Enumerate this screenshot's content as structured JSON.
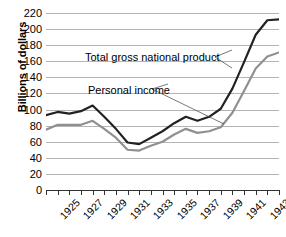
{
  "chart_data": {
    "type": "line",
    "title": "",
    "xlabel": "",
    "ylabel": "Billions of dollars",
    "ylim": [
      0,
      220
    ],
    "xlim": [
      1925,
      1945
    ],
    "grid": true,
    "legend_position": "inline-annotations",
    "y_ticks": [
      0,
      20,
      40,
      60,
      80,
      100,
      120,
      140,
      160,
      180,
      200,
      220
    ],
    "x_ticks": [
      1925,
      1926,
      1927,
      1928,
      1929,
      1930,
      1931,
      1932,
      1933,
      1934,
      1935,
      1936,
      1937,
      1938,
      1939,
      1940,
      1941,
      1942,
      1943,
      1944,
      1945
    ],
    "x_tick_labels": [
      "1925",
      "",
      "1927",
      "",
      "1929",
      "",
      "1931",
      "",
      "1933",
      "",
      "1935",
      "",
      "1937",
      "",
      "1939",
      "",
      "1941",
      "",
      "1943",
      "",
      "1945"
    ],
    "x_labels_visible": [
      "1925",
      "1927",
      "1929",
      "1931",
      "1933",
      "1935",
      "1937",
      "1939",
      "1941",
      "1943",
      "1945"
    ],
    "x": [
      1925,
      1926,
      1927,
      1928,
      1929,
      1930,
      1931,
      1932,
      1933,
      1934,
      1935,
      1936,
      1937,
      1938,
      1939,
      1940,
      1941,
      1942,
      1943,
      1944,
      1945
    ],
    "series": [
      {
        "name": "Total gross national product",
        "color": "#222222",
        "values": [
          93,
          97,
          95,
          98,
          105,
          91,
          76,
          59,
          57,
          65,
          73,
          83,
          91,
          86,
          91,
          101,
          126,
          159,
          193,
          211,
          212
        ]
      },
      {
        "name": "Personal income",
        "color": "#909090",
        "values": [
          75,
          81,
          81,
          81,
          86,
          76,
          65,
          50,
          49,
          55,
          60,
          69,
          76,
          71,
          73,
          78,
          96,
          123,
          151,
          166,
          171
        ]
      }
    ],
    "annotations": [
      {
        "text": "Total gross national product",
        "target_x": 1941,
        "target_y": 135
      },
      {
        "text": "Personal income",
        "target_x": 1940.6,
        "target_y": 92
      }
    ]
  },
  "axes": {
    "y_title": "Billions of dollars"
  }
}
